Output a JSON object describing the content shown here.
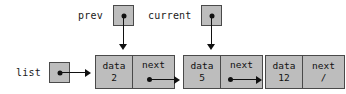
{
  "diagram": {
    "colors": {
      "box_fill": "#bdbdbd",
      "box_border": "#4a4a4a",
      "ink": "#111111",
      "background": "#ffffff"
    },
    "pointers": [
      {
        "name": "prev",
        "label": "prev",
        "points_to_node_index": 0
      },
      {
        "name": "current",
        "label": "current",
        "points_to_node_index": 1
      }
    ],
    "head": {
      "name": "list",
      "label": "list",
      "points_to_node_index": 0
    },
    "field_labels": {
      "data": "data",
      "next": "next"
    },
    "null_symbol": "/",
    "nodes": [
      {
        "data_label": "data",
        "data_value": "2",
        "next_label": "next",
        "next_value": "",
        "next_is_null": false
      },
      {
        "data_label": "data",
        "data_value": "5",
        "next_label": "next",
        "next_value": "",
        "next_is_null": false
      },
      {
        "data_label": "data",
        "data_value": "12",
        "next_label": "next",
        "next_value": "/",
        "next_is_null": true
      }
    ]
  }
}
